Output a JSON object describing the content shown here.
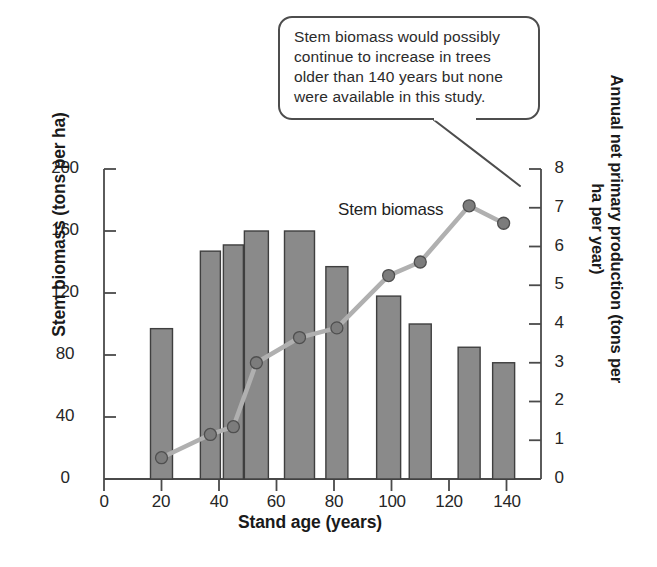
{
  "callout": {
    "text": "Stem biomass would possibly continue to increase in trees older than 140 years but none were available in this study."
  },
  "series_label": "Stem biomass",
  "colors": {
    "bar_fill": "#8a8a8a",
    "bar_stroke": "#3f3f3f",
    "line": "#b0b0b0",
    "marker": "#7c7c7c",
    "marker_stroke": "#4f4f4f",
    "axis": "#4a4a4a",
    "text": "#231f20"
  },
  "chart_data": {
    "type": "bar",
    "title": "",
    "xlabel": "Stand age (years)",
    "ylabel": "Stem biomass (tons per ha)",
    "y2label": "Annual net primary production (tons per ha per year)",
    "xlim": [
      0,
      152
    ],
    "ylim": [
      0,
      200
    ],
    "y2lim": [
      0,
      8
    ],
    "xticks": [
      0,
      20,
      40,
      60,
      80,
      100,
      120,
      140
    ],
    "yticks": [
      0,
      40,
      80,
      120,
      160,
      200
    ],
    "y2ticks": [
      0,
      1,
      2,
      3,
      4,
      5,
      6,
      7,
      8
    ],
    "grid": false,
    "legend": "inline-label",
    "x": [
      20,
      37,
      45,
      53,
      68,
      81,
      99,
      110,
      127,
      139
    ],
    "series": [
      {
        "name": "Stem biomass",
        "axis": "left",
        "render": "bar",
        "units": "tons per ha",
        "values": [
          97,
          147,
          151,
          160,
          160,
          137,
          118,
          100,
          85,
          75
        ]
      },
      {
        "name": "Annual net primary production",
        "axis": "right",
        "render": "line",
        "units": "tons per ha per year",
        "values": [
          0.55,
          1.15,
          1.35,
          3.0,
          3.65,
          3.9,
          5.25,
          5.6,
          7.05,
          6.6
        ]
      }
    ],
    "bar_widths": [
      22,
      20,
      20,
      24,
      30,
      22,
      24,
      22,
      22,
      22
    ],
    "annotations": [
      {
        "text": "Stem biomass would possibly continue to increase in trees older than 140 years but none were available in this study.",
        "kind": "speech-bubble",
        "points_to_x": 139
      }
    ]
  }
}
